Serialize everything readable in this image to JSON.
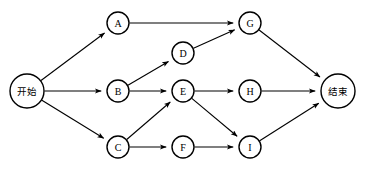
{
  "diagram": {
    "type": "directed-graph",
    "canvas": {
      "width": 365,
      "height": 175,
      "background": "#ffffff"
    },
    "style": {
      "node_fill": "#ffffff",
      "node_stroke": "#000000",
      "edge_stroke": "#000000",
      "node_stroke_width": 1.4,
      "edge_stroke_width": 1.1
    },
    "nodes": [
      {
        "id": "start",
        "label": "开始",
        "cjk": true,
        "cx": 27,
        "cy": 91,
        "r": 17
      },
      {
        "id": "A",
        "label": "A",
        "cjk": false,
        "cx": 118,
        "cy": 23,
        "r": 11
      },
      {
        "id": "B",
        "label": "B",
        "cjk": false,
        "cx": 118,
        "cy": 91,
        "r": 11
      },
      {
        "id": "C",
        "label": "C",
        "cjk": false,
        "cx": 118,
        "cy": 147,
        "r": 11
      },
      {
        "id": "D",
        "label": "D",
        "cjk": false,
        "cx": 183,
        "cy": 53,
        "r": 11
      },
      {
        "id": "E",
        "label": "E",
        "cjk": false,
        "cx": 183,
        "cy": 91,
        "r": 11
      },
      {
        "id": "F",
        "label": "F",
        "cjk": false,
        "cx": 183,
        "cy": 147,
        "r": 11
      },
      {
        "id": "G",
        "label": "G",
        "cjk": false,
        "cx": 250,
        "cy": 23,
        "r": 11
      },
      {
        "id": "H",
        "label": "H",
        "cjk": false,
        "cx": 250,
        "cy": 91,
        "r": 11
      },
      {
        "id": "I",
        "label": "I",
        "cjk": false,
        "cx": 250,
        "cy": 147,
        "r": 11
      },
      {
        "id": "end",
        "label": "结束",
        "cjk": true,
        "cx": 338,
        "cy": 91,
        "r": 17
      }
    ],
    "edges": [
      {
        "from": "start",
        "to": "A"
      },
      {
        "from": "start",
        "to": "B"
      },
      {
        "from": "start",
        "to": "C"
      },
      {
        "from": "A",
        "to": "G"
      },
      {
        "from": "B",
        "to": "D"
      },
      {
        "from": "B",
        "to": "E"
      },
      {
        "from": "C",
        "to": "E"
      },
      {
        "from": "C",
        "to": "F"
      },
      {
        "from": "D",
        "to": "G"
      },
      {
        "from": "E",
        "to": "H"
      },
      {
        "from": "E",
        "to": "I"
      },
      {
        "from": "F",
        "to": "I"
      },
      {
        "from": "G",
        "to": "end"
      },
      {
        "from": "H",
        "to": "end"
      },
      {
        "from": "I",
        "to": "end"
      }
    ]
  }
}
